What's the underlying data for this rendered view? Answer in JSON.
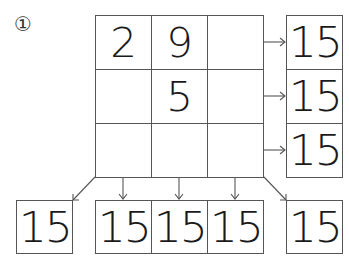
{
  "problem": {
    "number_label": "①"
  },
  "grid": {
    "rows": [
      [
        "2",
        "9",
        ""
      ],
      [
        "",
        "5",
        ""
      ],
      [
        "",
        "",
        ""
      ]
    ]
  },
  "row_sums": [
    "15",
    "15",
    "15"
  ],
  "column_sums": [
    "15",
    "15",
    "15"
  ],
  "diagonal_sums": {
    "left": "15",
    "right": "15"
  },
  "colors": {
    "line": "#555555",
    "text": "#1a1a1a",
    "background": "#ffffff"
  }
}
